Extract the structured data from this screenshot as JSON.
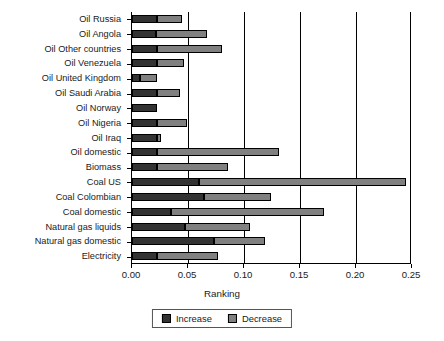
{
  "chart_data": {
    "type": "bar",
    "orientation": "horizontal",
    "stacked": true,
    "title": "",
    "xlabel": "Ranking",
    "ylabel": "",
    "xlim": [
      0.0,
      0.25
    ],
    "xticks": [
      0.0,
      0.05,
      0.1,
      0.15,
      0.2,
      0.25
    ],
    "xticklabels": [
      "0.00",
      "0.05",
      "0.10",
      "0.15",
      "0.20",
      "0.25"
    ],
    "grid": "vertical",
    "legend_position": "bottom-center",
    "categories": [
      "Oil Russia",
      "Oil Angola",
      "Oil Other countries",
      "Oil Venezuela",
      "Oil United Kingdom",
      "Oil Saudi Arabia",
      "Oil Norway",
      "Oil Nigeria",
      "Oil Iraq",
      "Oil domestic",
      "Biomass",
      "Coal US",
      "Coal Colombian",
      "Coal domestic",
      "Natural gas liquids",
      "Natural gas domestic",
      "Electricity"
    ],
    "series": [
      {
        "name": "Increase",
        "color": "#333333",
        "values": [
          0.022,
          0.021,
          0.022,
          0.022,
          0.007,
          0.022,
          0.022,
          0.022,
          0.022,
          0.022,
          0.022,
          0.06,
          0.064,
          0.035,
          0.047,
          0.073,
          0.022
        ]
      },
      {
        "name": "Decrease",
        "color": "#808080",
        "values": [
          0.023,
          0.046,
          0.058,
          0.024,
          0.015,
          0.021,
          0.0,
          0.027,
          0.004,
          0.109,
          0.064,
          0.185,
          0.06,
          0.136,
          0.058,
          0.046,
          0.055
        ]
      }
    ],
    "totals": [
      0.045,
      0.067,
      0.08,
      0.046,
      0.022,
      0.043,
      0.022,
      0.049,
      0.026,
      0.131,
      0.086,
      0.245,
      0.124,
      0.171,
      0.105,
      0.119,
      0.077
    ]
  },
  "legend": {
    "items": [
      {
        "label": "Increase",
        "color": "#333333"
      },
      {
        "label": "Decrease",
        "color": "#808080"
      }
    ]
  },
  "axis": {
    "x_title": "Ranking"
  }
}
